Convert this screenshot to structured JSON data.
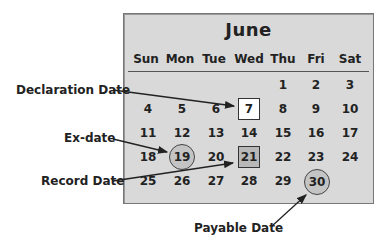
{
  "calendar": {
    "month": "June",
    "weekdays": [
      "Sun",
      "Mon",
      "Tue",
      "Wed",
      "Thu",
      "Fri",
      "Sat"
    ],
    "weeks": [
      [
        "",
        "",
        "",
        "",
        "1",
        "2",
        "3"
      ],
      [
        "4",
        "5",
        "6",
        "7",
        "8",
        "9",
        "10"
      ],
      [
        "11",
        "12",
        "13",
        "14",
        "15",
        "16",
        "17"
      ],
      [
        "18",
        "19",
        "20",
        "21",
        "22",
        "23",
        "24"
      ],
      [
        "25",
        "26",
        "27",
        "28",
        "29",
        "30",
        ""
      ]
    ],
    "highlights": {
      "declaration": "7",
      "ex": "19",
      "record": "21",
      "payable": "30"
    }
  },
  "annotations": {
    "declaration_date": "Declaration Date",
    "ex_date": "Ex-date",
    "record_date": "Record Date",
    "payable_date": "Payable Date"
  }
}
